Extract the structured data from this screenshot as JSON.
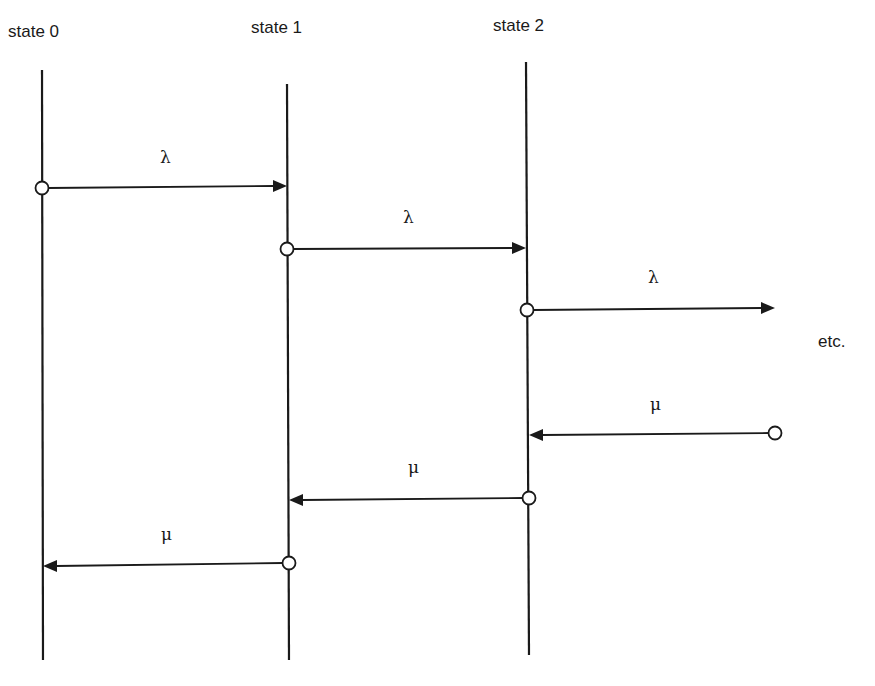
{
  "diagram": {
    "type": "state-transition",
    "states": [
      {
        "label": "state  0",
        "x": 42,
        "y_top": 70,
        "y_bottom": 660,
        "label_x": 8,
        "label_y": 37
      },
      {
        "label": "state  1",
        "x": 288,
        "y_top": 84,
        "y_bottom": 660,
        "label_x": 251,
        "label_y": 33
      },
      {
        "label": "state  2",
        "x": 528,
        "y_top": 62,
        "y_bottom": 655,
        "label_x": 493,
        "label_y": 31
      }
    ],
    "transitions": [
      {
        "symbol": "λ",
        "name": "arrival",
        "from_x": 42,
        "from_y": 188,
        "to_x": 287,
        "to_y": 186,
        "label_x": 165,
        "label_y": 163
      },
      {
        "symbol": "λ",
        "name": "arrival",
        "from_x": 287,
        "from_y": 249,
        "to_x": 526,
        "to_y": 248,
        "label_x": 409,
        "label_y": 223
      },
      {
        "symbol": "λ",
        "name": "arrival",
        "from_x": 527,
        "from_y": 310,
        "to_x": 775,
        "to_y": 308,
        "label_x": 654,
        "label_y": 283
      },
      {
        "symbol": "μ",
        "name": "departure",
        "from_x": 775,
        "from_y": 433,
        "to_x": 529,
        "to_y": 435,
        "label_x": 656,
        "label_y": 410
      },
      {
        "symbol": "μ",
        "name": "departure",
        "from_x": 529,
        "from_y": 498,
        "to_x": 289,
        "to_y": 500,
        "label_x": 414,
        "label_y": 473
      },
      {
        "symbol": "μ",
        "name": "departure",
        "from_x": 289,
        "from_y": 563,
        "to_x": 43,
        "to_y": 566,
        "label_x": 167,
        "label_y": 540
      }
    ],
    "continuation": {
      "label": "etc.",
      "x": 818,
      "y": 347
    }
  },
  "text": {
    "state0": "state  0",
    "state1": "state  1",
    "state2": "state  2",
    "lambda": "λ",
    "mu": "μ",
    "etc": "etc."
  }
}
